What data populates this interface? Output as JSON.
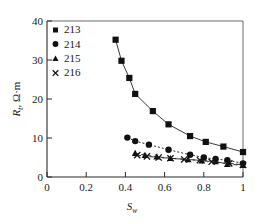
{
  "chart_data": {
    "type": "scatter",
    "title": "",
    "subtitle": "",
    "xlabel": "S_w",
    "ylabel": "R_t, Ω·m",
    "xlabel_base": "S",
    "xlabel_sub": "w",
    "ylabel_base": "R",
    "ylabel_sub": "t",
    "ylabel_units": ", Ω·m",
    "xlim": [
      0,
      1
    ],
    "ylim": [
      0,
      40
    ],
    "xticks": [
      0,
      0.2,
      0.4,
      0.6,
      0.8,
      1
    ],
    "xtick_labels": [
      "0",
      "0.2",
      "0.4",
      "0.6",
      "0.8",
      "1"
    ],
    "yticks": [
      0,
      10,
      20,
      30,
      40
    ],
    "ytick_labels": [
      "0",
      "10",
      "20",
      "30",
      "40"
    ],
    "grid": false,
    "legend_position": "top-left-inside",
    "series": [
      {
        "name": "213",
        "marker": "square",
        "line": "solid",
        "x": [
          0.35,
          0.38,
          0.42,
          0.45,
          0.54,
          0.62,
          0.73,
          0.81,
          0.9,
          1.0
        ],
        "y": [
          35.2,
          29.8,
          25.4,
          21.3,
          16.9,
          13.5,
          10.5,
          9.0,
          7.8,
          6.4
        ]
      },
      {
        "name": "214",
        "marker": "circle",
        "line": "dotted",
        "x": [
          0.41,
          0.45,
          0.52,
          0.62,
          0.73,
          0.8,
          0.86,
          0.92,
          1.0
        ],
        "y": [
          10.1,
          9.2,
          8.3,
          7.0,
          5.7,
          5.0,
          4.6,
          4.3,
          3.5
        ]
      },
      {
        "name": "215",
        "marker": "triangle",
        "line": "dashed",
        "x": [
          0.45,
          0.5,
          0.56,
          0.63,
          0.72,
          0.79,
          0.86,
          0.92,
          1.0
        ],
        "y": [
          6.1,
          5.6,
          5.2,
          4.8,
          4.5,
          4.2,
          4.0,
          3.3,
          3.0
        ]
      },
      {
        "name": "216",
        "marker": "cross",
        "line": "dashed",
        "x": [
          0.46,
          0.51,
          0.57,
          0.63,
          0.7,
          0.78,
          0.84,
          0.93,
          1.0
        ],
        "y": [
          5.6,
          5.3,
          5.0,
          4.8,
          4.5,
          4.3,
          3.9,
          3.5,
          3.1
        ]
      }
    ]
  },
  "legend": {
    "entries": [
      {
        "marker": "square",
        "label": "213"
      },
      {
        "marker": "circle",
        "label": "214"
      },
      {
        "marker": "triangle",
        "label": "215"
      },
      {
        "marker": "cross",
        "label": "216"
      }
    ]
  },
  "axes": {
    "x_tick_0": "0",
    "x_tick_1": "0.2",
    "x_tick_2": "0.4",
    "x_tick_3": "0.6",
    "x_tick_4": "0.8",
    "x_tick_5": "1",
    "y_tick_0": "0",
    "y_tick_1": "10",
    "y_tick_2": "20",
    "y_tick_3": "30",
    "y_tick_4": "40"
  }
}
